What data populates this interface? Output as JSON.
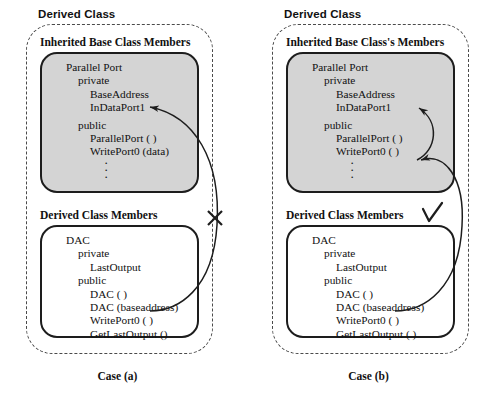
{
  "diagram": {
    "title_font_note": "",
    "cases": [
      {
        "id": "case-a",
        "derived_class_title": "Derived Class",
        "inherited_title": "Inherited Base Class Members",
        "members_title": "Derived Class Members",
        "base_box": {
          "class_name": "Parallel Port",
          "private_label": "private",
          "private_members": [
            "BaseAddress",
            "InDataPort1"
          ],
          "public_label": "public",
          "public_members": [
            "ParallelPort ( )",
            "WritePort0 (data)"
          ],
          "ellipsis": "·"
        },
        "derived_box": {
          "class_name": "DAC",
          "private_label": "private",
          "private_members": [
            "LastOutput"
          ],
          "public_label": "public",
          "public_members": [
            "DAC ( )",
            "DAC (baseaddress)",
            "WritePort0 ( )",
            "GetLastOutput ()"
          ]
        },
        "marker": "cross",
        "marker_symbol": "✕",
        "case_label": "Case (a)"
      },
      {
        "id": "case-b",
        "derived_class_title": "Derived Class",
        "inherited_title": "Inherited Base Class's Members",
        "members_title": "Derived Class Members",
        "base_box": {
          "class_name": "Parallel Port",
          "private_label": "private",
          "private_members": [
            "BaseAddress",
            "InDataPort1"
          ],
          "public_label": "public",
          "public_members": [
            "ParallelPort ( )",
            "WritePort0 ( )"
          ],
          "ellipsis": "·"
        },
        "derived_box": {
          "class_name": "DAC",
          "private_label": "private",
          "private_members": [
            "LastOutput"
          ],
          "public_label": "public",
          "public_members": [
            "DAC ( )",
            "DAC (baseaddress)",
            "WritePort0 ( )",
            "GetLastOutput ( )"
          ]
        },
        "marker": "check",
        "marker_symbol": "✓",
        "case_label": "Case (b)"
      }
    ],
    "colors": {
      "base_box_fill": "#d4d4d4",
      "derived_box_fill": "#ffffff",
      "stroke": "#1d1d1d",
      "dashed_stroke": "#4a4a4a",
      "text": "#111111"
    }
  }
}
